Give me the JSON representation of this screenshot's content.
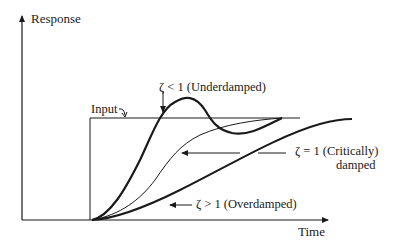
{
  "diagram": {
    "axes": {
      "y_label": "Response",
      "x_label": "Time"
    },
    "input_label": "Input",
    "curves": [
      {
        "id": "underdamped",
        "label": "ζ < 1 (Underdamped)",
        "stroke": "thick"
      },
      {
        "id": "critically-damped",
        "label_line1": "ζ = 1 (Critically)",
        "label_line2": "damped",
        "stroke": "thin"
      },
      {
        "id": "overdamped",
        "label": "ζ > 1 (Overdamped)",
        "stroke": "thick"
      }
    ],
    "colors": {
      "ink": "#1a1a1a",
      "background": "#ffffff"
    }
  }
}
